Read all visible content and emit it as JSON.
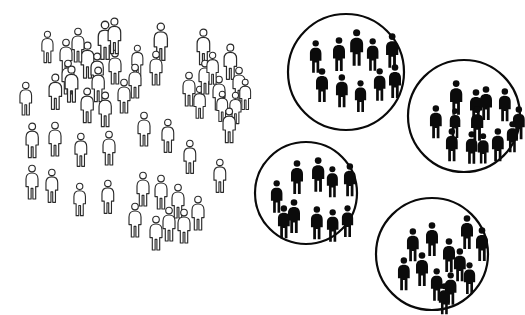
{
  "diagram": {
    "type": "pictogram-diagram",
    "canvas": {
      "width": 525,
      "height": 315,
      "background": "#ffffff"
    },
    "icon_names": {
      "population_person": "person-icon",
      "cluster_person": "person-icon",
      "cluster_boundary": "circle-outline-icon"
    },
    "colors": {
      "population_figure_fill": "#ffffff",
      "population_figure_stroke": "#2b2b2b",
      "cluster_figure_fill": "#0b0b0b",
      "circle_stroke": "#0a0a0a",
      "background": "#ffffff"
    },
    "counts": {
      "population_figures": 52,
      "clusters": 4,
      "cluster_figures_total": 43
    }
  },
  "population": {
    "label": "dispersed population",
    "figure_style": "outline",
    "figures": [
      {
        "x": 58,
        "y": 39,
        "s": 1.0
      },
      {
        "x": 96,
        "y": 21,
        "s": 1.13
      },
      {
        "x": 40,
        "y": 31,
        "s": 0.93
      },
      {
        "x": 79,
        "y": 42,
        "s": 1.06
      },
      {
        "x": 152,
        "y": 23,
        "s": 1.1
      },
      {
        "x": 195,
        "y": 29,
        "s": 1.05
      },
      {
        "x": 60,
        "y": 60,
        "s": 1.0
      },
      {
        "x": 89,
        "y": 53,
        "s": 1.02
      },
      {
        "x": 107,
        "y": 50,
        "s": 1.0
      },
      {
        "x": 130,
        "y": 45,
        "s": 0.92
      },
      {
        "x": 222,
        "y": 44,
        "s": 1.04
      },
      {
        "x": 18,
        "y": 82,
        "s": 0.97
      },
      {
        "x": 47,
        "y": 74,
        "s": 1.04
      },
      {
        "x": 63,
        "y": 66,
        "s": 1.06
      },
      {
        "x": 90,
        "y": 67,
        "s": 1.02
      },
      {
        "x": 127,
        "y": 64,
        "s": 1.0
      },
      {
        "x": 148,
        "y": 51,
        "s": 1.0
      },
      {
        "x": 181,
        "y": 72,
        "s": 1.0
      },
      {
        "x": 192,
        "y": 86,
        "s": 0.95
      },
      {
        "x": 211,
        "y": 76,
        "s": 1.0
      },
      {
        "x": 231,
        "y": 67,
        "s": 1.0
      },
      {
        "x": 215,
        "y": 91,
        "s": 0.9
      },
      {
        "x": 228,
        "y": 92,
        "s": 0.93
      },
      {
        "x": 79,
        "y": 88,
        "s": 1.02
      },
      {
        "x": 97,
        "y": 92,
        "s": 1.02
      },
      {
        "x": 136,
        "y": 112,
        "s": 1.0
      },
      {
        "x": 160,
        "y": 119,
        "s": 0.98
      },
      {
        "x": 221,
        "y": 108,
        "s": 1.02
      },
      {
        "x": 24,
        "y": 123,
        "s": 1.02
      },
      {
        "x": 47,
        "y": 122,
        "s": 1.0
      },
      {
        "x": 73,
        "y": 133,
        "s": 0.98
      },
      {
        "x": 101,
        "y": 131,
        "s": 1.0
      },
      {
        "x": 182,
        "y": 140,
        "s": 0.98
      },
      {
        "x": 212,
        "y": 159,
        "s": 0.98
      },
      {
        "x": 24,
        "y": 165,
        "s": 1.0
      },
      {
        "x": 44,
        "y": 169,
        "s": 0.98
      },
      {
        "x": 72,
        "y": 183,
        "s": 0.96
      },
      {
        "x": 100,
        "y": 180,
        "s": 0.98
      },
      {
        "x": 135,
        "y": 172,
        "s": 1.0
      },
      {
        "x": 153,
        "y": 175,
        "s": 1.0
      },
      {
        "x": 170,
        "y": 184,
        "s": 1.0
      },
      {
        "x": 127,
        "y": 203,
        "s": 1.0
      },
      {
        "x": 148,
        "y": 216,
        "s": 1.0
      },
      {
        "x": 161,
        "y": 207,
        "s": 1.0
      },
      {
        "x": 176,
        "y": 209,
        "s": 1.0
      },
      {
        "x": 190,
        "y": 196,
        "s": 1.0
      },
      {
        "x": 106,
        "y": 18,
        "s": 1.05
      },
      {
        "x": 70,
        "y": 28,
        "s": 1.0
      },
      {
        "x": 197,
        "y": 60,
        "s": 1.0
      },
      {
        "x": 205,
        "y": 52,
        "s": 0.95
      },
      {
        "x": 238,
        "y": 79,
        "s": 0.9
      },
      {
        "x": 116,
        "y": 79,
        "s": 1.0
      }
    ]
  },
  "clusters": [
    {
      "name": "cluster-1",
      "label": "cluster 1",
      "circle": {
        "cx": 346,
        "cy": 72,
        "r": 58
      },
      "figure_style": "solid",
      "member_count": 10,
      "figures": [
        {
          "x": 308,
          "y": 40,
          "s": 0.96
        },
        {
          "x": 331,
          "y": 37,
          "s": 1.0
        },
        {
          "x": 348,
          "y": 29,
          "s": 1.08
        },
        {
          "x": 365,
          "y": 38,
          "s": 0.96
        },
        {
          "x": 384,
          "y": 33,
          "s": 1.02
        },
        {
          "x": 314,
          "y": 68,
          "s": 1.0
        },
        {
          "x": 334,
          "y": 74,
          "s": 0.98
        },
        {
          "x": 353,
          "y": 80,
          "s": 0.94
        },
        {
          "x": 372,
          "y": 68,
          "s": 0.96
        },
        {
          "x": 387,
          "y": 64,
          "s": 1.0
        }
      ]
    },
    {
      "name": "cluster-2",
      "label": "cluster 2",
      "circle": {
        "cx": 464,
        "cy": 116,
        "r": 56
      },
      "figure_style": "solid",
      "member_count": 13,
      "figures": [
        {
          "x": 448,
          "y": 80,
          "s": 1.02
        },
        {
          "x": 468,
          "y": 89,
          "s": 1.0
        },
        {
          "x": 478,
          "y": 86,
          "s": 1.0
        },
        {
          "x": 497,
          "y": 88,
          "s": 0.98
        },
        {
          "x": 428,
          "y": 105,
          "s": 0.98
        },
        {
          "x": 448,
          "y": 108,
          "s": 0.88
        },
        {
          "x": 469,
          "y": 106,
          "s": 1.02
        },
        {
          "x": 511,
          "y": 106,
          "s": 0.98
        },
        {
          "x": 444,
          "y": 128,
          "s": 0.98
        },
        {
          "x": 464,
          "y": 131,
          "s": 0.96
        },
        {
          "x": 476,
          "y": 133,
          "s": 0.9
        },
        {
          "x": 490,
          "y": 128,
          "s": 0.98
        },
        {
          "x": 505,
          "y": 121,
          "s": 0.92
        }
      ]
    },
    {
      "name": "cluster-3",
      "label": "cluster 3",
      "circle": {
        "cx": 306,
        "cy": 193,
        "r": 51
      },
      "figure_style": "solid",
      "member_count": 10,
      "figures": [
        {
          "x": 289,
          "y": 160,
          "s": 1.0
        },
        {
          "x": 310,
          "y": 157,
          "s": 1.02
        },
        {
          "x": 325,
          "y": 166,
          "s": 0.92
        },
        {
          "x": 342,
          "y": 163,
          "s": 0.98
        },
        {
          "x": 269,
          "y": 180,
          "s": 0.96
        },
        {
          "x": 286,
          "y": 199,
          "s": 1.0
        },
        {
          "x": 276,
          "y": 205,
          "s": 0.98
        },
        {
          "x": 309,
          "y": 206,
          "s": 0.98
        },
        {
          "x": 325,
          "y": 209,
          "s": 0.96
        },
        {
          "x": 340,
          "y": 205,
          "s": 0.94
        }
      ]
    },
    {
      "name": "cluster-4",
      "label": "cluster 4",
      "circle": {
        "cx": 432,
        "cy": 254,
        "r": 56
      },
      "figure_style": "solid",
      "member_count": 12,
      "figures": [
        {
          "x": 405,
          "y": 228,
          "s": 0.98
        },
        {
          "x": 424,
          "y": 222,
          "s": 1.0
        },
        {
          "x": 441,
          "y": 238,
          "s": 1.0
        },
        {
          "x": 459,
          "y": 215,
          "s": 1.0
        },
        {
          "x": 474,
          "y": 227,
          "s": 1.0
        },
        {
          "x": 396,
          "y": 257,
          "s": 0.98
        },
        {
          "x": 414,
          "y": 252,
          "s": 1.0
        },
        {
          "x": 452,
          "y": 248,
          "s": 0.98
        },
        {
          "x": 429,
          "y": 268,
          "s": 0.96
        },
        {
          "x": 443,
          "y": 272,
          "s": 0.96
        },
        {
          "x": 462,
          "y": 262,
          "s": 0.94
        },
        {
          "x": 437,
          "y": 283,
          "s": 0.92
        }
      ]
    }
  ]
}
